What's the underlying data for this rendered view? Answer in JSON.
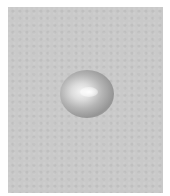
{
  "image": {
    "description": "Grayscale photograph of a small dome-shaped glossy bead or droplet on a textured gray surface",
    "colors": {
      "background": "#c9c9c9",
      "border": "#ffffff",
      "highlight": "#f4f4f4",
      "shadow": "#959595"
    }
  }
}
